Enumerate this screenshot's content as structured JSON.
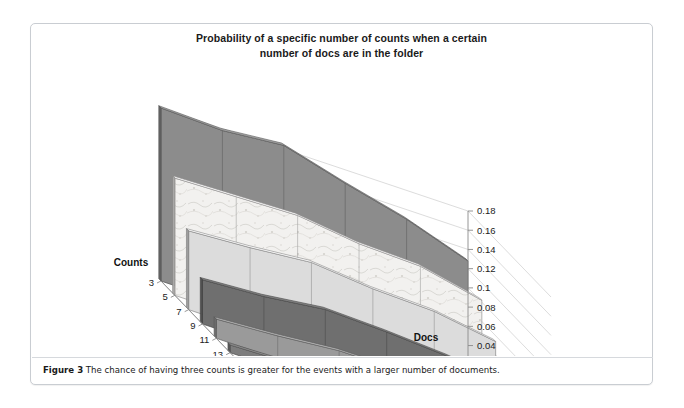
{
  "figure": {
    "title_line1": "Probability of a specific number of counts when a certain",
    "title_line2": "number of docs are in the folder",
    "caption_label": "Figure 3",
    "caption_text": " The chance of having three counts is greater for the events with a larger number of documents."
  },
  "chart_data": {
    "type": "area",
    "title": "Probability of a specific number of counts when a certain number of docs are in the folder",
    "xlabel": "Docs",
    "ylabel": "Counts",
    "zlabel": "",
    "grid": true,
    "legend_position": "none",
    "projection": "3d-ribbon",
    "categories": [
      "6",
      "5",
      "4",
      "3",
      "2",
      "1"
    ],
    "x_tick_labels": [
      "6",
      "5",
      "4",
      "3",
      "2",
      "1"
    ],
    "series_axis_label": "Counts",
    "series_tick_labels": [
      "3",
      "5",
      "7",
      "9",
      "11",
      "13",
      "15"
    ],
    "zlim": [
      0,
      0.18
    ],
    "z_tick_labels": [
      "0",
      "0.02",
      "0.04",
      "0.06",
      "0.08",
      "0.1",
      "0.12",
      "0.14",
      "0.16",
      "0.18"
    ],
    "z_tick_values": [
      0,
      0.02,
      0.04,
      0.06,
      0.08,
      0.1,
      0.12,
      0.14,
      0.16,
      0.18
    ],
    "series": [
      {
        "name": "3",
        "color": "#8c8c8c",
        "pattern": "solid",
        "values": [
          0.18,
          0.178,
          0.184,
          0.166,
          0.15,
          0.128
        ]
      },
      {
        "name": "5",
        "color": "#f0efed",
        "pattern": "marble",
        "values": [
          0.122,
          0.124,
          0.126,
          0.118,
          0.116,
          0.102
        ]
      },
      {
        "name": "7",
        "color": "#dcdcdc",
        "pattern": "solid",
        "values": [
          0.082,
          0.086,
          0.092,
          0.086,
          0.084,
          0.074
        ]
      },
      {
        "name": "9",
        "color": "#6f6f6f",
        "pattern": "solid",
        "values": [
          0.046,
          0.05,
          0.058,
          0.056,
          0.052,
          0.044
        ]
      },
      {
        "name": "11",
        "color": "#9a9a9a",
        "pattern": "solid",
        "values": [
          0.02,
          0.024,
          0.03,
          0.03,
          0.028,
          0.022
        ]
      },
      {
        "name": "13",
        "color": "#7d7d7d",
        "pattern": "solid",
        "values": [
          0.008,
          0.01,
          0.013,
          0.014,
          0.012,
          0.01
        ]
      },
      {
        "name": "15",
        "color": "#a5a5a5",
        "pattern": "solid",
        "values": [
          0.003,
          0.004,
          0.005,
          0.005,
          0.005,
          0.004
        ]
      }
    ]
  }
}
